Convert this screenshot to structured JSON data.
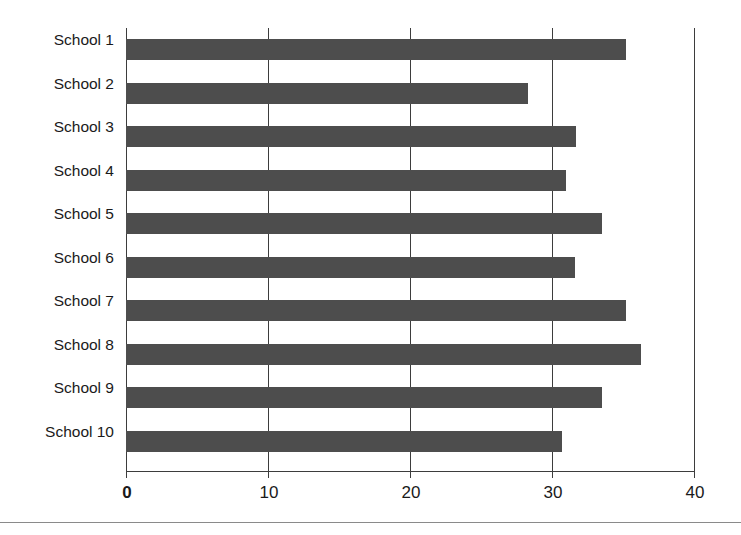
{
  "chart_data": {
    "type": "bar",
    "orientation": "horizontal",
    "title": "",
    "xlabel": "",
    "ylabel": "",
    "categories": [
      "School 1",
      "School 2",
      "School 3",
      "School 4",
      "School 5",
      "School 6",
      "School 7",
      "School 8",
      "School 9",
      "School 10"
    ],
    "values": [
      35.2,
      28.3,
      31.7,
      31.0,
      33.5,
      31.6,
      35.2,
      36.3,
      33.5,
      30.7
    ],
    "xlim": [
      0,
      40
    ],
    "xticks": [
      0,
      10,
      20,
      30,
      40
    ],
    "xtick_labels": [
      "0",
      "10",
      "20",
      "30",
      "40"
    ],
    "grid": "vertical",
    "legend": "none",
    "bar_color": "#4d4d4d",
    "axis_color": "#3d3d3d",
    "background_color": "#ffffff"
  },
  "figure": {
    "separator_rule_color": "#8a8a8a"
  }
}
